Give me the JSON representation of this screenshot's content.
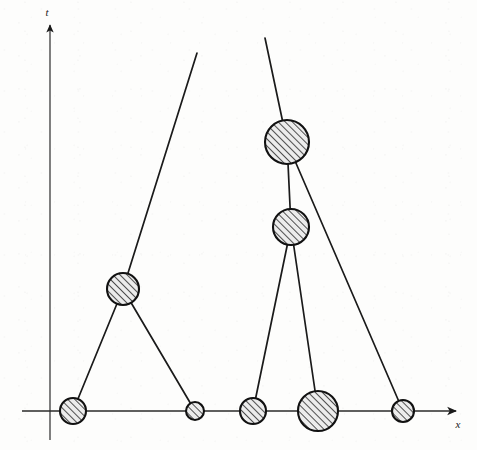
{
  "figure": {
    "kind": "line-diagram",
    "background_color": "#fdfdfc",
    "ink_color": "#1a1a1a",
    "vertex_fill_pattern": "diagonal-hatch",
    "vertex_fill_color": "#e8e8e8",
    "hatch_color": "#1a1a1a"
  },
  "axes": {
    "vertical": {
      "name": "t",
      "label": "t",
      "label_x": 47,
      "label_y": 16,
      "x": 50,
      "y_top": 25,
      "y_bottom": 440,
      "arrow_at": "top"
    },
    "horizontal": {
      "name": "x",
      "label": "x",
      "label_x": 458,
      "label_y": 428,
      "y": 411,
      "x_left": 22,
      "x_right": 456,
      "arrow_at": "right"
    }
  },
  "chart_data": {
    "type": "scatter",
    "xlabel": "x",
    "ylabel": "t",
    "grid": false,
    "legend": null,
    "origin_px": {
      "x": 50,
      "y": 411
    },
    "nodes": [
      {
        "id": "n1",
        "label": "",
        "cx": 73,
        "cy": 411,
        "r": 13,
        "on_axis": true,
        "group": "left-structure"
      },
      {
        "id": "n2",
        "label": "",
        "cx": 123,
        "cy": 289,
        "r": 16,
        "on_axis": false,
        "group": "left-structure"
      },
      {
        "id": "n3",
        "label": "",
        "cx": 195,
        "cy": 411,
        "r": 9,
        "on_axis": true,
        "group": "left-structure"
      },
      {
        "id": "n4",
        "label": "",
        "cx": 253,
        "cy": 411,
        "r": 13,
        "on_axis": true,
        "group": "right-structure"
      },
      {
        "id": "n5",
        "label": "",
        "cx": 291,
        "cy": 227,
        "r": 18,
        "on_axis": false,
        "group": "right-structure"
      },
      {
        "id": "n6",
        "label": "",
        "cx": 287,
        "cy": 142,
        "r": 22,
        "on_axis": false,
        "group": "right-structure"
      },
      {
        "id": "n7",
        "label": "",
        "cx": 318,
        "cy": 411,
        "r": 20,
        "on_axis": true,
        "group": "right-structure"
      },
      {
        "id": "n8",
        "label": "",
        "cx": 403,
        "cy": 411,
        "r": 11,
        "on_axis": true,
        "group": "right-structure"
      }
    ],
    "edges": [
      {
        "id": "e1",
        "from": "n1",
        "to": "n2",
        "x1": 73,
        "y1": 411,
        "x2": 123,
        "y2": 289
      },
      {
        "id": "e2",
        "from": "n2",
        "to": "n3",
        "x1": 123,
        "y1": 289,
        "x2": 195,
        "y2": 411
      },
      {
        "id": "e3",
        "from": "n2",
        "to": "open-top-left",
        "x1": 123,
        "y1": 289,
        "x2": 197,
        "y2": 53
      },
      {
        "id": "e4",
        "from": "n6",
        "to": "open-top-right",
        "x1": 287,
        "y1": 142,
        "x2": 265,
        "y2": 38
      },
      {
        "id": "e5",
        "from": "n6",
        "to": "n5",
        "x1": 287,
        "y1": 142,
        "x2": 291,
        "y2": 227
      },
      {
        "id": "e6",
        "from": "n6",
        "to": "n8",
        "x1": 289,
        "y1": 147,
        "x2": 403,
        "y2": 411
      },
      {
        "id": "e7",
        "from": "n5",
        "to": "n4",
        "x1": 291,
        "y1": 227,
        "x2": 253,
        "y2": 411
      },
      {
        "id": "e8",
        "from": "n5",
        "to": "n7",
        "x1": 291,
        "y1": 227,
        "x2": 318,
        "y2": 411
      }
    ]
  }
}
